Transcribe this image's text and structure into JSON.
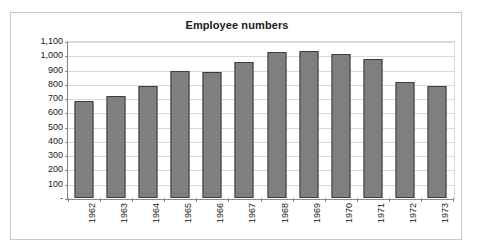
{
  "chart_data": {
    "type": "bar",
    "title": "Employee numbers",
    "xlabel": "",
    "ylabel": "",
    "categories": [
      "1962",
      "1963",
      "1964",
      "1965",
      "1966",
      "1967",
      "1968",
      "1969",
      "1970",
      "1971",
      "1972",
      "1973"
    ],
    "values": [
      680,
      715,
      785,
      890,
      880,
      950,
      1025,
      1030,
      1010,
      975,
      810,
      783
    ],
    "series": [
      {
        "name": "Employee numbers",
        "values": [
          680,
          715,
          785,
          890,
          880,
          950,
          1025,
          1030,
          1010,
          975,
          810,
          783
        ]
      }
    ],
    "ylim": [
      0,
      1100
    ],
    "ytick_values": [
      0,
      100,
      200,
      300,
      400,
      500,
      600,
      700,
      800,
      900,
      1000,
      1100
    ],
    "ytick_labels": [
      "-",
      "100",
      "200",
      "300",
      "400",
      "500",
      "600",
      "700",
      "800",
      "900",
      "1,000",
      "1,100"
    ],
    "grid": "horizontal",
    "legend": "none",
    "bar_color": "#7f7f7f",
    "bar_border_color": "#3d3d3d",
    "gridline_color": "#d9d9d9",
    "axis_color": "#8a8a8a",
    "frame_color": "#c9c9c9",
    "background_color": "#ffffff",
    "xtick_rotation": "-90"
  }
}
